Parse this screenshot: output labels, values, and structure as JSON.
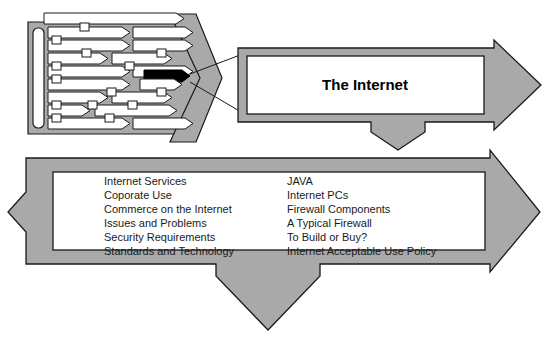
{
  "figure": {
    "title_box_label": "The Internet",
    "colors": {
      "arrow_fill": "#a9a9a9",
      "arrow_stroke": "#1a1a1a",
      "inner_fill": "#ffffff",
      "highlight_fill": "#000000",
      "text": "#1a1a1a",
      "page_background": "#ffffff"
    },
    "network_panel": {
      "name": "corporate-network-cloud",
      "highlighted_link_label": ""
    },
    "topics": {
      "left_column": [
        "Internet Services",
        "Coporate Use",
        "Commerce on the Internet",
        "Issues and Problems",
        "Security Requirements",
        "Standards and Technology"
      ],
      "right_column": [
        "JAVA",
        "Internet PCs",
        "Firewall Components",
        "A Typical Firewall",
        "To Build or Buy?",
        "Internet Acceptable Use Policy"
      ]
    }
  }
}
